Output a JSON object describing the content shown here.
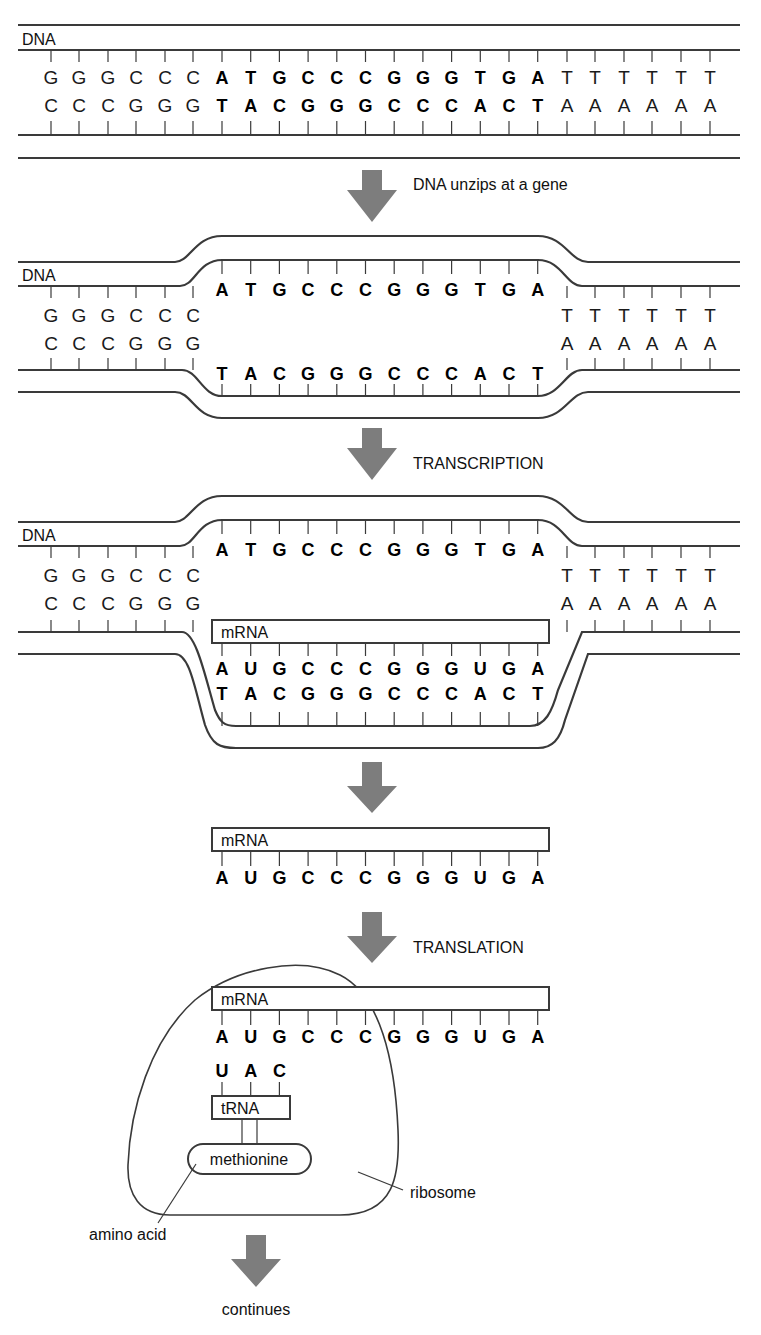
{
  "diagram": {
    "colors": {
      "strand": "#3a3a3a",
      "arrow": "#7d7d7d",
      "text": "#111111"
    }
  },
  "panel1": {
    "label": "DNA",
    "top_strand": [
      "G",
      "G",
      "G",
      "C",
      "C",
      "C",
      "A",
      "T",
      "G",
      "C",
      "C",
      "C",
      "G",
      "G",
      "G",
      "T",
      "G",
      "A",
      "T",
      "T",
      "T",
      "T",
      "T",
      "T"
    ],
    "bottom_strand": [
      "C",
      "C",
      "C",
      "G",
      "G",
      "G",
      "T",
      "A",
      "C",
      "G",
      "G",
      "G",
      "C",
      "C",
      "C",
      "A",
      "C",
      "T",
      "A",
      "A",
      "A",
      "A",
      "A",
      "A"
    ]
  },
  "step1": {
    "label": "DNA unzips at a gene",
    "icon": "down-arrow-icon"
  },
  "panel2": {
    "label": "DNA",
    "left_top": [
      "G",
      "G",
      "G",
      "C",
      "C",
      "C"
    ],
    "left_bottom": [
      "C",
      "C",
      "C",
      "G",
      "G",
      "G"
    ],
    "gene_top": [
      "A",
      "T",
      "G",
      "C",
      "C",
      "C",
      "G",
      "G",
      "G",
      "T",
      "G",
      "A"
    ],
    "gene_bottom": [
      "T",
      "A",
      "C",
      "G",
      "G",
      "G",
      "C",
      "C",
      "C",
      "A",
      "C",
      "T"
    ],
    "right_top": [
      "T",
      "T",
      "T",
      "T",
      "T",
      "T"
    ],
    "right_bottom": [
      "A",
      "A",
      "A",
      "A",
      "A",
      "A"
    ]
  },
  "step2": {
    "label": "TRANSCRIPTION",
    "icon": "down-arrow-icon"
  },
  "panel3": {
    "label": "DNA",
    "left_top": [
      "G",
      "G",
      "G",
      "C",
      "C",
      "C"
    ],
    "left_bottom": [
      "C",
      "C",
      "C",
      "G",
      "G",
      "G"
    ],
    "gene_top": [
      "A",
      "T",
      "G",
      "C",
      "C",
      "C",
      "G",
      "G",
      "G",
      "T",
      "G",
      "A"
    ],
    "mrna_label": "mRNA",
    "mrna": [
      "A",
      "U",
      "G",
      "C",
      "C",
      "C",
      "G",
      "G",
      "G",
      "U",
      "G",
      "A"
    ],
    "gene_bottom": [
      "T",
      "A",
      "C",
      "G",
      "G",
      "G",
      "C",
      "C",
      "C",
      "A",
      "C",
      "T"
    ],
    "right_top": [
      "T",
      "T",
      "T",
      "T",
      "T",
      "T"
    ],
    "right_bottom": [
      "A",
      "A",
      "A",
      "A",
      "A",
      "A"
    ]
  },
  "step3": {
    "label": "",
    "icon": "down-arrow-icon"
  },
  "panel4": {
    "mrna_label": "mRNA",
    "mrna": [
      "A",
      "U",
      "G",
      "C",
      "C",
      "C",
      "G",
      "G",
      "G",
      "U",
      "G",
      "A"
    ]
  },
  "step4": {
    "label": "TRANSLATION",
    "icon": "down-arrow-icon"
  },
  "panel5": {
    "mrna_label": "mRNA",
    "mrna": [
      "A",
      "U",
      "G",
      "C",
      "C",
      "C",
      "G",
      "G",
      "G",
      "U",
      "G",
      "A"
    ],
    "anticodon": [
      "U",
      "A",
      "C"
    ],
    "trna_label": "tRNA",
    "amino_acid_name": "methionine",
    "amino_acid_callout": "amino acid",
    "ribosome_callout": "ribosome"
  },
  "step5": {
    "label": "continues",
    "icon": "down-arrow-icon"
  }
}
